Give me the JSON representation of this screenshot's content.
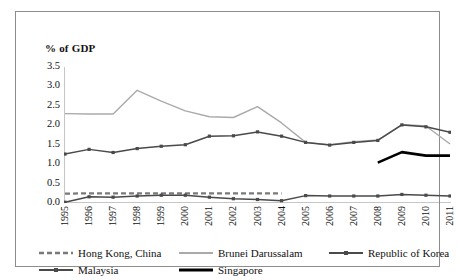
{
  "chart_data": {
    "type": "line",
    "title": "",
    "subtitle": "",
    "ylabel": "% of GDP",
    "xlabel": "",
    "ylim": [
      0.0,
      3.5
    ],
    "yticks": [
      "0.0",
      "0.5",
      "1.0",
      "1.5",
      "2.0",
      "2.5",
      "3.0",
      "3.5"
    ],
    "ytick_values": [
      0.0,
      0.5,
      1.0,
      1.5,
      2.0,
      2.5,
      3.0,
      3.5
    ],
    "grid": false,
    "legend_position": "bottom",
    "x": [
      1995,
      1996,
      1997,
      1998,
      1999,
      2000,
      2001,
      2002,
      2003,
      2004,
      2005,
      2006,
      2007,
      2008,
      2009,
      2010,
      2011
    ],
    "categories": [
      "1995",
      "1996",
      "1997",
      "1998",
      "1999",
      "2000",
      "2001",
      "2002",
      "2003",
      "2004",
      "2005",
      "2006",
      "2007",
      "2008",
      "2009",
      "2010",
      "2011"
    ],
    "series": [
      {
        "name": "Hong Kong, China",
        "color": "#7a7a7a",
        "style": "dashed",
        "markers": false,
        "values": [
          0.24,
          0.25,
          0.25,
          0.25,
          0.25,
          0.25,
          0.25,
          0.25,
          0.25,
          0.25,
          null,
          null,
          null,
          null,
          null,
          null,
          null
        ]
      },
      {
        "name": "Brunei Darussalam",
        "color": "#aaaaaa",
        "style": "solid",
        "markers": false,
        "values": [
          2.3,
          2.29,
          2.29,
          2.9,
          2.62,
          2.37,
          2.22,
          2.2,
          2.48,
          2.06,
          1.56,
          1.5,
          1.58,
          1.62,
          2.02,
          1.98,
          1.52
        ]
      },
      {
        "name": "Republic of Korea",
        "color": "#4a4a4a",
        "style": "solid",
        "markers": true,
        "values": [
          1.26,
          1.38,
          1.3,
          1.4,
          1.46,
          1.5,
          1.72,
          1.73,
          1.83,
          1.72,
          1.56,
          1.49,
          1.56,
          1.61,
          2.01,
          1.96,
          1.82
        ]
      },
      {
        "name": "Malaysia",
        "color": "#4a4a4a",
        "style": "solid",
        "markers": true,
        "values": [
          0.02,
          0.16,
          0.15,
          0.18,
          0.2,
          0.2,
          0.15,
          0.11,
          0.09,
          0.06,
          0.19,
          0.18,
          0.18,
          0.18,
          0.22,
          0.2,
          0.18
        ]
      },
      {
        "name": "Singapore",
        "color": "#000000",
        "style": "solid-thick",
        "markers": false,
        "values": [
          null,
          null,
          null,
          null,
          null,
          null,
          null,
          null,
          null,
          null,
          null,
          null,
          null,
          1.04,
          1.31,
          1.22,
          1.22
        ]
      }
    ],
    "legend": [
      {
        "label": "Hong Kong, China",
        "key": "dashed-gray"
      },
      {
        "label": "Brunei Darussalam",
        "key": "solid-lightgray"
      },
      {
        "label": "Republic of Korea",
        "key": "solid-darkgray-marker"
      },
      {
        "label": "Malaysia",
        "key": "solid-darkgray-marker"
      },
      {
        "label": "Singapore",
        "key": "solid-black-thick"
      }
    ]
  }
}
